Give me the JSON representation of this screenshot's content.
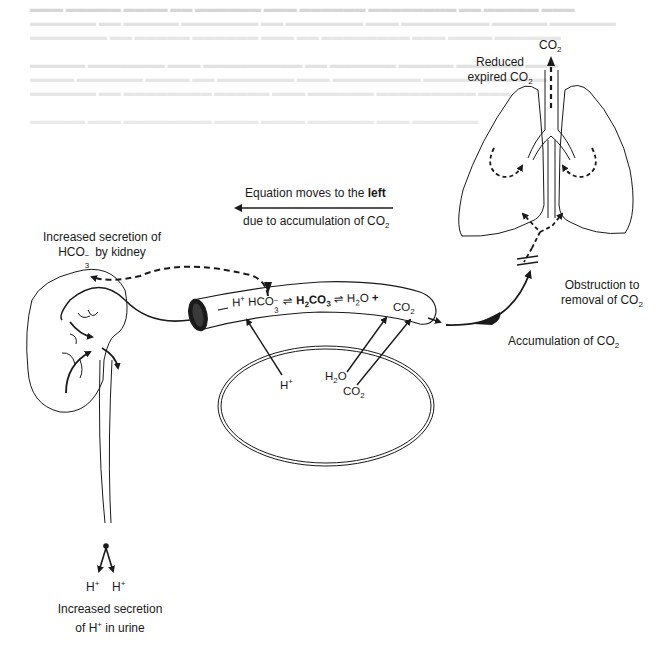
{
  "diagram": {
    "title_equation": {
      "line1_prefix": "Equation moves to the ",
      "line1_bold": "left",
      "line2": "due to accumulation of CO",
      "line2_sub": "2"
    },
    "lungs": {
      "top_label": "CO",
      "top_label_sub": "2",
      "reduced_line1": "Reduced",
      "reduced_line2": "expired CO",
      "reduced_line2_sub": "2"
    },
    "obstruction": {
      "line1": "Obstruction to",
      "line2": "removal of CO",
      "line2_sub": "2"
    },
    "accumulation": {
      "text": "Accumulation of CO",
      "sub": "2"
    },
    "kidney_top": {
      "line1": "Increased secretion of",
      "line2_a": "HCO",
      "line2_sub": "3",
      "line2_sup": "−",
      "line2_b": " by kidney"
    },
    "vessel_equation": {
      "h": "H",
      "h_sup": "+",
      "hco": "HCO",
      "hco_sub": "3",
      "hco_sup": "−",
      "arrows1": "⇌",
      "h2co3_a": "H",
      "h2co3_sub": "2",
      "h2co3_b": "CO",
      "h2co3_sub2": "3",
      "arrows2": "⇌",
      "h2o_a": "H",
      "h2o_sub": "2",
      "h2o_b": "O",
      "plus": "+",
      "co2": "CO",
      "co2_sub": "2"
    },
    "cell": {
      "h": "H",
      "h_sup": "+",
      "h2o_a": "H",
      "h2o_sub": "2",
      "h2o_b": "O",
      "co2": "CO",
      "co2_sub": "2"
    },
    "urine": {
      "h1": "H",
      "h1_sup": "+",
      "h2": "H",
      "h2_sup": "+",
      "line1": "Increased secretion",
      "line2_a": "of H",
      "line2_sup": "+",
      "line2_b": " in urine"
    }
  },
  "colors": {
    "ink": "#1a1a1a",
    "bleed_text": "#d6d6d6",
    "background": "#ffffff"
  }
}
